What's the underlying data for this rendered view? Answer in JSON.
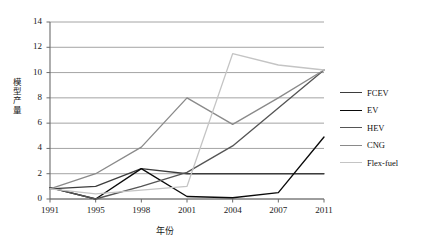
{
  "chart_data": {
    "type": "line",
    "title": "",
    "xlabel": "年份",
    "ylabel": "模型产量",
    "categories": [
      "1991",
      "1995",
      "1998",
      "2001",
      "2004",
      "2007",
      "2011"
    ],
    "ylim": [
      0,
      14
    ],
    "yticks": [
      0,
      2,
      4,
      6,
      8,
      10,
      12,
      14
    ],
    "grid": true,
    "legend_position": "right",
    "series": [
      {
        "name": "FCEV",
        "color": "#3d3d3d",
        "values": [
          0.8,
          1.0,
          2.4,
          2.0,
          2.0,
          2.0,
          2.0
        ]
      },
      {
        "name": "EV",
        "color": "#0a0a0a",
        "values": [
          0.9,
          0.0,
          2.4,
          0.2,
          0.1,
          0.5,
          4.9
        ]
      },
      {
        "name": "HEV",
        "color": "#555555",
        "values": [
          0.9,
          0.0,
          1.0,
          2.1,
          4.2,
          7.2,
          10.2
        ]
      },
      {
        "name": "CNG",
        "color": "#8a8a8a",
        "values": [
          0.8,
          2.0,
          4.1,
          8.0,
          5.9,
          8.0,
          10.2
        ]
      },
      {
        "name": "Flex-fuel",
        "color": "#c4c4c4",
        "values": [
          0.8,
          0.4,
          0.7,
          1.0,
          11.5,
          10.6,
          10.2
        ]
      }
    ]
  },
  "legend": {
    "items": [
      {
        "label": "FCEV"
      },
      {
        "label": "EV"
      },
      {
        "label": "HEV"
      },
      {
        "label": "CNG"
      },
      {
        "label": "Flex-fuel"
      }
    ]
  },
  "axes": {
    "y_label_chars": [
      "模",
      "型",
      "产",
      "量"
    ],
    "x_label": "年份"
  }
}
